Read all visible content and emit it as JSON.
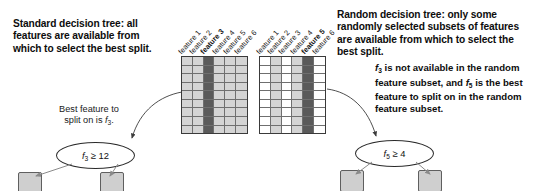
{
  "figure": {
    "accent_dark": "#5a5a5a",
    "accent_light": "#d4d4d4",
    "leaf_fill": "#cfcfcf",
    "stroke": "#3a3a3a"
  },
  "left_panel": {
    "headline": "Standard decision tree: all\nfeatures are available from\nwhich to select the best split.",
    "caption": "Best feature to\nsplit on is f3.",
    "node_label": "f3 ≥ 12",
    "node_feature": "f",
    "node_subscript": "3",
    "node_comparison": "≥ 12",
    "feature_labels": [
      {
        "label": "feature 1",
        "bold": false,
        "shade": "light"
      },
      {
        "label": "feature 2",
        "bold": false,
        "shade": "light"
      },
      {
        "label": "feature 3",
        "bold": true,
        "shade": "dark"
      },
      {
        "label": "feature 4",
        "bold": false,
        "shade": "light"
      },
      {
        "label": "feature 5",
        "bold": false,
        "shade": "light"
      },
      {
        "label": "feature 6",
        "bold": false,
        "shade": "light"
      }
    ],
    "matrix_rows": 9,
    "matrix_cols": 6,
    "leaf_labels": [
      "",
      ""
    ]
  },
  "right_panel": {
    "headline": "Random decision tree: only some\nrandomly selected subsets of features\nare available from which to select the\nbest split.",
    "note": "f3 is not available in the random\nfeature subset, and f5 is the best\nfeature to split on in the random\nfeature subset.",
    "node_label": "f5 ≥ 4",
    "node_feature": "f",
    "node_subscript": "5",
    "node_comparison": "≥ 4",
    "feature_labels": [
      {
        "label": "feature 1",
        "bold": false,
        "shade": "white"
      },
      {
        "label": "feature 2",
        "bold": false,
        "shade": "light"
      },
      {
        "label": "feature 3",
        "bold": false,
        "shade": "white"
      },
      {
        "label": "feature 4",
        "bold": false,
        "shade": "light"
      },
      {
        "label": "feature 5",
        "bold": true,
        "shade": "dark"
      },
      {
        "label": "feature 6",
        "bold": false,
        "shade": "white"
      }
    ],
    "matrix_rows": 9,
    "matrix_cols": 6,
    "leaf_labels": [
      "",
      ""
    ]
  }
}
